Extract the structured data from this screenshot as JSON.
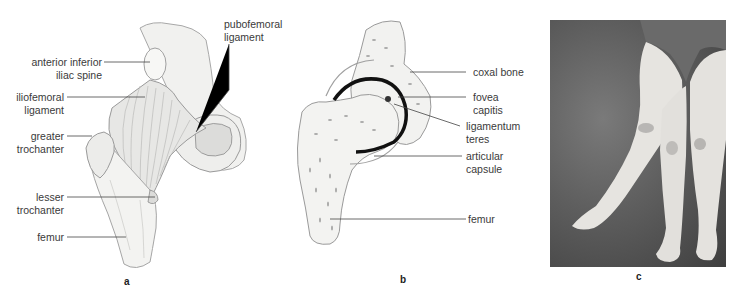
{
  "figure": {
    "panels": [
      {
        "id": "a",
        "letter": "a",
        "description": "anterior view of hip joint ligaments",
        "labels": {
          "anterior_inferior_iliac_spine_1": "anterior inferior",
          "anterior_inferior_iliac_spine_2": "iliac spine",
          "iliofemoral_ligament_1": "iliofemoral",
          "iliofemoral_ligament_2": "ligament",
          "pubofemoral_ligament_1": "pubofemoral",
          "pubofemoral_ligament_2": "ligament",
          "greater_trochanter_1": "greater",
          "greater_trochanter_2": "trochanter",
          "lesser_trochanter_1": "lesser",
          "lesser_trochanter_2": "trochanter",
          "femur": "femur"
        }
      },
      {
        "id": "b",
        "letter": "b",
        "description": "coronal section of hip joint",
        "labels": {
          "coxal_bone": "coxal bone",
          "fovea_capitis_1": "fovea",
          "fovea_capitis_2": "capitis",
          "ligamentum_teres_1": "ligamentum",
          "ligamentum_teres_2": "teres",
          "articular_capsule_1": "articular",
          "articular_capsule_2": "capsule",
          "femur": "femur"
        }
      },
      {
        "id": "c",
        "letter": "c",
        "description": "photograph of legs showing hip abduction"
      }
    ],
    "colors": {
      "label_text": "#3a3a3a",
      "leader_line": "#444444",
      "bone_fill": "#f2f2f0",
      "bone_stroke": "#9a9a9a",
      "cartilage": "#111111",
      "photo_bg": "#5e5e5e",
      "skin": "#e8e6e2"
    }
  }
}
